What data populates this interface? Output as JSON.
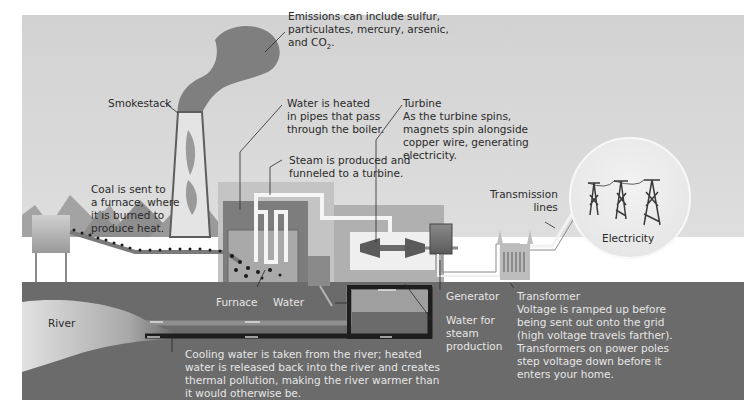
{
  "diagram": {
    "colors": {
      "sky": "#d6d6d6",
      "ground": "#6b6b6b",
      "river": "#c9c9c9",
      "smoke": "#7a7a7a",
      "building": "#bdbdbd",
      "pipe_dark": "#1e1e1e",
      "steam": "#f4f4f4",
      "text_dark": "#2a2a2a",
      "text_light": "#e6e6e6"
    },
    "labels": {
      "emissions": "Emissions can include sulfur,\nparticulates, mercury, arsenic,\nand CO",
      "emissions_sub": "2",
      "emissions_end": ".",
      "smokestack": "Smokestack",
      "water_heated": "Water is heated\nin pipes that pass\nthrough the boiler.",
      "steam": "Steam is produced and\nfunneled to a turbine.",
      "turbine_title": "Turbine",
      "turbine_desc": "As the turbine spins,\nmagnets spin alongside\ncopper wire, generating\nelectricity.",
      "coal": "Coal is sent to\na furnace, where\nit is burned to\nproduce heat.",
      "transmission_lines": "Transmission\nlines",
      "electricity": "Electricity",
      "furnace": "Furnace",
      "water": "Water",
      "generator": "Generator",
      "water_for_steam": "Water for\nsteam\nproduction",
      "transformer_title": "Transformer",
      "transformer_desc": "Voltage is ramped up before\nbeing sent out onto the grid\n(high voltage travels farther).\nTransformers on power poles\nstep voltage down before it\nenters your home.",
      "river": "River",
      "cooling": "Cooling water is taken from the river; heated\nwater is released back into the river and creates\nthermal pollution, making the river warmer than\nit would otherwise be."
    }
  }
}
